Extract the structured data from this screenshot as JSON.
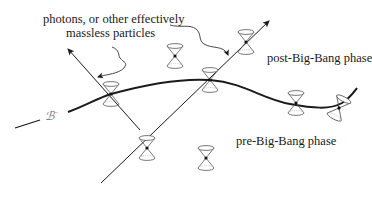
{
  "labels": {
    "photons_line1": "photons, or other effectively",
    "photons_line2": "massless particles",
    "post_phase": "post-Big-Bang phase",
    "pre_phase": "pre-Big-Bang phase",
    "hypersurface_symbol": "ℬ",
    "hypersurface_sup": "−"
  },
  "colors": {
    "ink": "#1a1a1a",
    "cone_stroke": "#555555",
    "background": "#ffffff"
  },
  "elements": {
    "hypersurface_curve": "ℬ⁻ boundary curve",
    "photon_worldlines": [
      "left worldline arrow",
      "right worldline arrow"
    ],
    "light_cones": [
      {
        "id": "cone-left-on-curve",
        "x": 111,
        "y": 94
      },
      {
        "id": "cone-center-on-curve",
        "x": 210,
        "y": 80
      },
      {
        "id": "cone-upper-on-line",
        "x": 246,
        "y": 42
      },
      {
        "id": "cone-upper-free",
        "x": 174,
        "y": 56
      },
      {
        "id": "cone-right-on-curve",
        "x": 296,
        "y": 103
      },
      {
        "id": "cone-far-right-tilted",
        "x": 338,
        "y": 110
      },
      {
        "id": "cone-lower-on-line",
        "x": 147,
        "y": 148
      },
      {
        "id": "cone-lower-free",
        "x": 206,
        "y": 158
      }
    ]
  }
}
